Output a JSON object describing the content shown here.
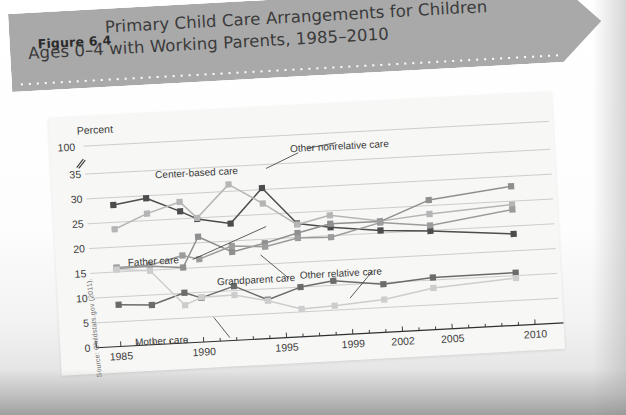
{
  "figure": {
    "number_label": "Figure 6.4",
    "title_line1": "Primary Child Care Arrangements for Children",
    "title_line2": "Ages 0–4 with Working Parents, 1985–2010",
    "banner_color": "#a9a9a9"
  },
  "source_note": "Source: Childstats.gov (2011).",
  "chart_data": {
    "type": "line",
    "title": "Primary Child Care Arrangements for Children Ages 0–4 with Working Parents, 1985–2010",
    "xlabel": "",
    "ylabel": "Percent",
    "ylim": [
      0,
      35
    ],
    "y_axis_note": "100",
    "y_axis_break": true,
    "yticks": [
      0,
      5,
      10,
      15,
      20,
      25,
      30,
      35
    ],
    "ytick_labels": [
      "0",
      "5",
      "10",
      "15",
      "20",
      "25",
      "30",
      "35"
    ],
    "grid": true,
    "legend": "annotated-inline",
    "x": [
      1985,
      1987,
      1989,
      1990,
      1992,
      1994,
      1996,
      1998,
      2001,
      2004,
      2009
    ],
    "xticks": [
      1985,
      1990,
      1995,
      1999,
      2002,
      2005,
      2010
    ],
    "xtick_labels": [
      "1985",
      "1990",
      "1995",
      "1999",
      "2002",
      "2005",
      "2010"
    ],
    "xlim": [
      1984,
      2011
    ],
    "series": [
      {
        "name": "Center-based care",
        "color": "#4c4c4c",
        "values": [
          28.5,
          29.5,
          26.5,
          24.8,
          23.5,
          30.3,
          22.8,
          21.7,
          20.5,
          19.9,
          18.4
        ]
      },
      {
        "name": "Other nonrelative care",
        "color": "#b5b5b5",
        "values": [
          23.6,
          26.4,
          28.4,
          25.0,
          31.4,
          27.2,
          22.6,
          24.1,
          22.4,
          23.3,
          24.3
        ]
      },
      {
        "name": "Father care",
        "color": "#8f8f8f",
        "values": [
          15.7,
          15.8,
          15.2,
          21.2,
          17.8,
          19.2,
          20.9,
          22.4,
          22.3,
          26.1,
          28.0
        ]
      },
      {
        "name": "Grandparent care",
        "color": "#9c9c9c",
        "values": [
          15.9,
          16.0,
          17.6,
          16.7,
          19.0,
          18.5,
          19.9,
          19.7,
          22.1,
          21.0,
          23.3
        ]
      },
      {
        "name": "Other relative care",
        "color": "#6b6b6b",
        "values": [
          8.4,
          8.0,
          10.1,
          8.9,
          10.9,
          7.8,
          10.0,
          10.9,
          9.7,
          10.5,
          10.6
        ]
      },
      {
        "name": "Mother care",
        "color": "#cdcdcd",
        "values": [
          15.5,
          14.9,
          7.6,
          9.0,
          9.1,
          7.6,
          5.6,
          5.9,
          6.6,
          8.4,
          9.5
        ]
      }
    ],
    "annotations": [
      {
        "label": "Center-based care",
        "x": 104,
        "y": 66
      },
      {
        "label": "Other nonrelative care",
        "x": 240,
        "y": 47
      },
      {
        "label": "Father care",
        "x": 72,
        "y": 152
      },
      {
        "label": "Grandparent care",
        "x": 160,
        "y": 176
      },
      {
        "label": "Other relative care",
        "x": 243,
        "y": 174
      },
      {
        "label": "Mother care",
        "x": 75,
        "y": 232
      }
    ]
  }
}
